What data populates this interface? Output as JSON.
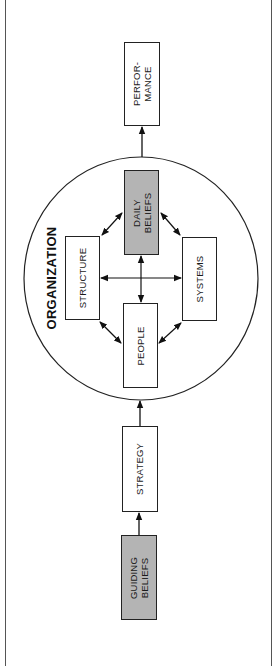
{
  "diagram": {
    "orientation": "rotated -90deg (flow bottom to top)",
    "container": {
      "label": "ORGANIZATION"
    },
    "nodes": {
      "guiding_beliefs": {
        "label": "GUIDING\nBELIEFS",
        "shaded": true
      },
      "strategy": {
        "label": "STRATEGY",
        "shaded": false
      },
      "people": {
        "label": "PEOPLE",
        "shaded": false
      },
      "structure": {
        "label": "STRUCTURE",
        "shaded": false
      },
      "systems": {
        "label": "SYSTEMS",
        "shaded": false
      },
      "daily_beliefs": {
        "label": "DAILY\nBELIEFS",
        "shaded": true
      },
      "performance": {
        "label": "PERFOR-\nMANCE",
        "shaded": false
      }
    },
    "edges": [
      {
        "from": "GUIDING BELIEFS",
        "to": "STRATEGY",
        "type": "one-way"
      },
      {
        "from": "STRATEGY",
        "to": "ORGANIZATION",
        "type": "one-way"
      },
      {
        "from": "ORGANIZATION",
        "to": "PERFORMANCE",
        "type": "one-way"
      },
      {
        "from": "STRUCTURE",
        "to": "DAILY BELIEFS",
        "type": "two-way"
      },
      {
        "from": "DAILY BELIEFS",
        "to": "SYSTEMS",
        "type": "two-way"
      },
      {
        "from": "STRUCTURE",
        "to": "PEOPLE",
        "type": "two-way"
      },
      {
        "from": "PEOPLE",
        "to": "SYSTEMS",
        "type": "two-way"
      },
      {
        "from": "STRUCTURE",
        "to": "SYSTEMS",
        "type": "two-way"
      },
      {
        "from": "DAILY BELIEFS",
        "to": "PEOPLE",
        "type": "two-way"
      }
    ],
    "colors": {
      "shaded_fill": "#b4b4b4",
      "stroke": "#222222",
      "background": "#ffffff"
    }
  }
}
